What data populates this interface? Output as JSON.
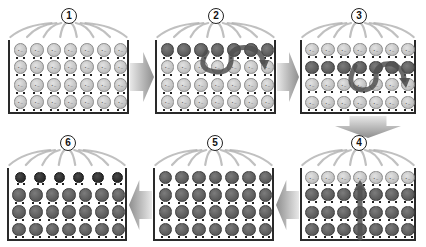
{
  "diagram": {
    "title": "",
    "colors": {
      "light_molecule": "#c4c4c4",
      "dark_molecule": "#5e5e5e",
      "darkest_molecule": "#2e2e2e",
      "box_border": "#2a2a2a",
      "arrow": "#9a9a9a",
      "heat_lines": "#b0b0b0",
      "motion_arrow": "#505050"
    },
    "panels": [
      {
        "step": "1",
        "box": {
          "x": 8,
          "y": 40,
          "w": 121,
          "h": 74
        },
        "badge": {
          "x": 61,
          "y": 8
        },
        "rows": [
          "light",
          "light",
          "light",
          "light"
        ],
        "cols": 7,
        "motion": "none",
        "description": "All molecules light (unchanged)"
      },
      {
        "step": "2",
        "box": {
          "x": 155,
          "y": 40,
          "w": 121,
          "h": 74
        },
        "badge": {
          "x": 208,
          "y": 8
        },
        "rows": [
          "dark",
          "light",
          "light",
          "light"
        ],
        "cols": 7,
        "motion": "curve-top-row",
        "description": "Top row turns dark; curved arrow showing movement"
      },
      {
        "step": "3",
        "box": {
          "x": 300,
          "y": 40,
          "w": 116,
          "h": 74
        },
        "badge": {
          "x": 351,
          "y": 8
        },
        "rows": [
          "light",
          "dark",
          "light",
          "light"
        ],
        "cols": 7,
        "motion": "curve-second-row",
        "description": "Dark row moves to second row; curved arrow"
      },
      {
        "step": "4",
        "box": {
          "x": 300,
          "y": 168,
          "w": 116,
          "h": 73
        },
        "badge": {
          "x": 351,
          "y": 135
        },
        "rows": [
          "light",
          "dark",
          "dark",
          "dark"
        ],
        "cols": 7,
        "motion": "vertical-up",
        "description": "Top row light, lower rows dark; vertical arrow upward"
      },
      {
        "step": "5",
        "box": {
          "x": 153,
          "y": 168,
          "w": 121,
          "h": 73
        },
        "badge": {
          "x": 207,
          "y": 135
        },
        "rows": [
          "dark",
          "dark",
          "dark",
          "dark"
        ],
        "cols": 7,
        "motion": "none",
        "description": "All molecules dark"
      },
      {
        "step": "6",
        "box": {
          "x": 7,
          "y": 168,
          "w": 120,
          "h": 73
        },
        "badge": {
          "x": 60,
          "y": 135
        },
        "rows": [
          "darkest6",
          "dark",
          "dark",
          "dark"
        ],
        "cols": 7,
        "motion": "none",
        "description": "Top row of 6 darkest molecules, rest dark"
      }
    ],
    "arrows": [
      {
        "from": "1",
        "to": "2",
        "direction": "right",
        "x": 130,
        "y": 52,
        "w": 24,
        "h": 50
      },
      {
        "from": "2",
        "to": "3",
        "direction": "right",
        "x": 277,
        "y": 52,
        "w": 22,
        "h": 50
      },
      {
        "from": "3",
        "to": "4",
        "direction": "down",
        "x": 335,
        "y": 116,
        "w": 66,
        "h": 22
      },
      {
        "from": "4",
        "to": "5",
        "direction": "left",
        "x": 276,
        "y": 180,
        "w": 23,
        "h": 50
      },
      {
        "from": "5",
        "to": "6",
        "direction": "left",
        "x": 129,
        "y": 180,
        "w": 23,
        "h": 50
      }
    ]
  }
}
